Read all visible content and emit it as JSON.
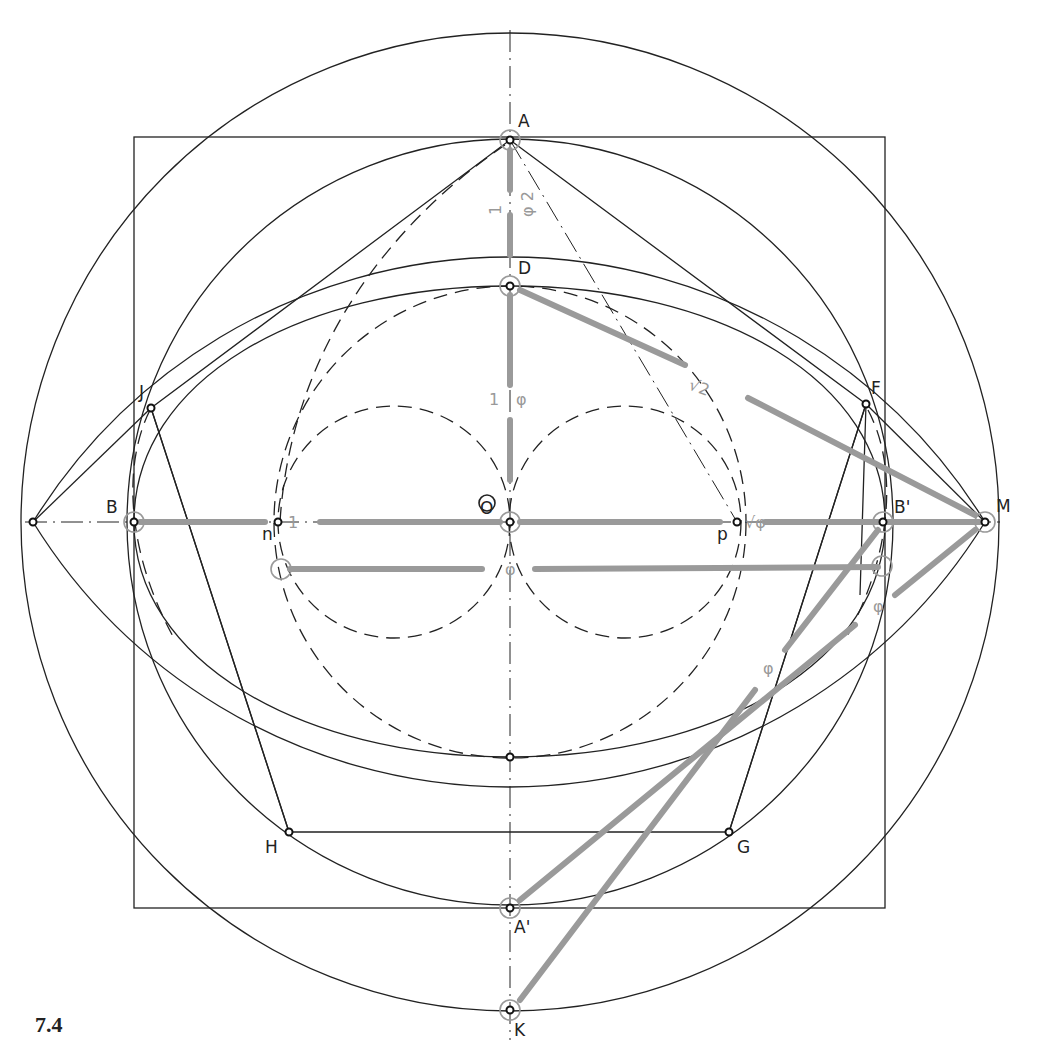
{
  "figure": {
    "number": "7.4",
    "center_label": "O"
  },
  "points": {
    "A": "A",
    "A_prime": "A'",
    "B": "B",
    "B_prime": "B'",
    "D": "D",
    "F": "F",
    "G": "G",
    "H": "H",
    "J": "J",
    "K": "K",
    "M": "M",
    "n": "n",
    "p": "p"
  },
  "annotations": {
    "one_left": "1",
    "one_upper": "1",
    "phi_squared": "φ 2",
    "one_mid": "1",
    "phi_mid": "φ",
    "sqrt2": "√2",
    "sqrt_phi": "√φ",
    "phi_center": "φ",
    "phi_right_a": "φ",
    "phi_right_b": "φ"
  },
  "colors": {
    "ink": "#222222",
    "highlight": "#9a9a9a"
  }
}
